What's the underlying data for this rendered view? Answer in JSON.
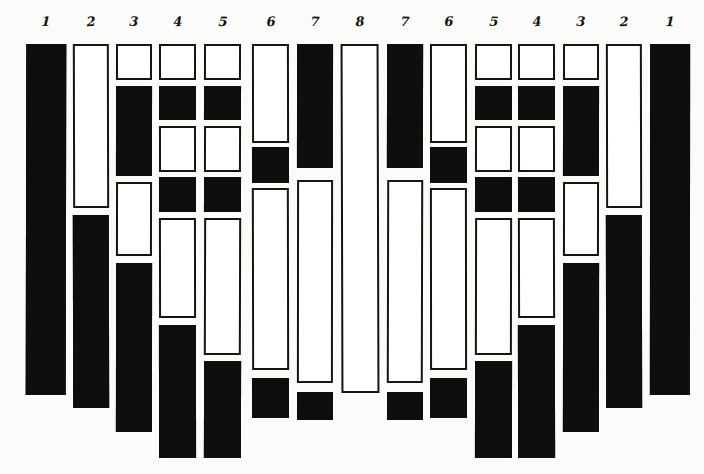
{
  "figure": {
    "title": "",
    "background_color": "#fbfbf9",
    "fill_color": "#100e0c",
    "open_color": "#ffffff",
    "stroke_color": "#16140f",
    "width": 704,
    "height": 474,
    "column_count": 15
  },
  "chart_data": {
    "type": "bar",
    "title": "",
    "xlabel": "",
    "ylabel": "",
    "grid": false,
    "legend": null,
    "orientation": "vertical",
    "categories": [
      "1",
      "2",
      "3",
      "4",
      "5",
      "6",
      "7",
      "8",
      "7",
      "6",
      "5",
      "4",
      "3",
      "2",
      "1"
    ],
    "columns": [
      {
        "label": "1",
        "x": 26,
        "width": 40,
        "segment_count": 1,
        "segments": [
          {
            "fill": "filled",
            "top": 44,
            "bottom": 395,
            "height": 351
          }
        ]
      },
      {
        "label": "2",
        "x": 73,
        "width": 36,
        "segment_count": 2,
        "segments": [
          {
            "fill": "open",
            "top": 44,
            "bottom": 208,
            "height": 164
          },
          {
            "fill": "filled",
            "top": 215,
            "bottom": 408,
            "height": 193
          }
        ]
      },
      {
        "label": "3",
        "x": 116,
        "width": 36,
        "segment_count": 4,
        "segments": [
          {
            "fill": "open",
            "top": 44,
            "bottom": 80,
            "height": 36
          },
          {
            "fill": "filled",
            "top": 86,
            "bottom": 176,
            "height": 90
          },
          {
            "fill": "open",
            "top": 182,
            "bottom": 256,
            "height": 74
          },
          {
            "fill": "filled",
            "top": 263,
            "bottom": 432,
            "height": 169
          }
        ]
      },
      {
        "label": "4",
        "x": 159,
        "width": 37,
        "segment_count": 6,
        "segments": [
          {
            "fill": "open",
            "top": 44,
            "bottom": 80,
            "height": 36
          },
          {
            "fill": "filled",
            "top": 86,
            "bottom": 120,
            "height": 34
          },
          {
            "fill": "open",
            "top": 126,
            "bottom": 172,
            "height": 46
          },
          {
            "fill": "filled",
            "top": 177,
            "bottom": 212,
            "height": 35
          },
          {
            "fill": "open",
            "top": 218,
            "bottom": 318,
            "height": 100
          },
          {
            "fill": "filled",
            "top": 325,
            "bottom": 458,
            "height": 133
          }
        ]
      },
      {
        "label": "5",
        "x": 204,
        "width": 37,
        "segment_count": 6,
        "segments": [
          {
            "fill": "open",
            "top": 44,
            "bottom": 80,
            "height": 36
          },
          {
            "fill": "filled",
            "top": 86,
            "bottom": 120,
            "height": 34
          },
          {
            "fill": "open",
            "top": 126,
            "bottom": 172,
            "height": 46
          },
          {
            "fill": "filled",
            "top": 177,
            "bottom": 212,
            "height": 35
          },
          {
            "fill": "open",
            "top": 218,
            "bottom": 355,
            "height": 137
          },
          {
            "fill": "filled",
            "top": 361,
            "bottom": 458,
            "height": 97
          }
        ]
      },
      {
        "label": "6",
        "x": 252,
        "width": 37,
        "segment_count": 4,
        "segments": [
          {
            "fill": "open",
            "top": 44,
            "bottom": 143,
            "height": 99
          },
          {
            "fill": "filled",
            "top": 147,
            "bottom": 183,
            "height": 36
          },
          {
            "fill": "open",
            "top": 188,
            "bottom": 370,
            "height": 182
          },
          {
            "fill": "filled",
            "top": 378,
            "bottom": 418,
            "height": 40
          }
        ]
      },
      {
        "label": "7",
        "x": 297,
        "width": 36,
        "segment_count": 3,
        "segments": [
          {
            "fill": "filled",
            "top": 44,
            "bottom": 168,
            "height": 124
          },
          {
            "fill": "open",
            "top": 180,
            "bottom": 383,
            "height": 203
          },
          {
            "fill": "filled",
            "top": 392,
            "bottom": 420,
            "height": 28
          }
        ]
      },
      {
        "label": "8",
        "x": 341,
        "width": 38,
        "segment_count": 1,
        "segments": [
          {
            "fill": "open",
            "top": 44,
            "bottom": 393,
            "height": 349
          }
        ]
      },
      {
        "label": "7",
        "x": 387,
        "width": 36,
        "segment_count": 3,
        "segments": [
          {
            "fill": "filled",
            "top": 44,
            "bottom": 168,
            "height": 124
          },
          {
            "fill": "open",
            "top": 180,
            "bottom": 383,
            "height": 203
          },
          {
            "fill": "filled",
            "top": 392,
            "bottom": 420,
            "height": 28
          }
        ]
      },
      {
        "label": "6",
        "x": 430,
        "width": 37,
        "segment_count": 4,
        "segments": [
          {
            "fill": "open",
            "top": 44,
            "bottom": 143,
            "height": 99
          },
          {
            "fill": "filled",
            "top": 147,
            "bottom": 183,
            "height": 36
          },
          {
            "fill": "open",
            "top": 188,
            "bottom": 370,
            "height": 182
          },
          {
            "fill": "filled",
            "top": 378,
            "bottom": 418,
            "height": 40
          }
        ]
      },
      {
        "label": "5",
        "x": 475,
        "width": 37,
        "segment_count": 6,
        "segments": [
          {
            "fill": "open",
            "top": 44,
            "bottom": 80,
            "height": 36
          },
          {
            "fill": "filled",
            "top": 86,
            "bottom": 120,
            "height": 34
          },
          {
            "fill": "open",
            "top": 126,
            "bottom": 172,
            "height": 46
          },
          {
            "fill": "filled",
            "top": 177,
            "bottom": 212,
            "height": 35
          },
          {
            "fill": "open",
            "top": 218,
            "bottom": 355,
            "height": 137
          },
          {
            "fill": "filled",
            "top": 361,
            "bottom": 458,
            "height": 97
          }
        ]
      },
      {
        "label": "4",
        "x": 518,
        "width": 37,
        "segment_count": 6,
        "segments": [
          {
            "fill": "open",
            "top": 44,
            "bottom": 80,
            "height": 36
          },
          {
            "fill": "filled",
            "top": 86,
            "bottom": 120,
            "height": 34
          },
          {
            "fill": "open",
            "top": 126,
            "bottom": 172,
            "height": 46
          },
          {
            "fill": "filled",
            "top": 177,
            "bottom": 212,
            "height": 35
          },
          {
            "fill": "open",
            "top": 218,
            "bottom": 318,
            "height": 100
          },
          {
            "fill": "filled",
            "top": 325,
            "bottom": 458,
            "height": 133
          }
        ]
      },
      {
        "label": "3",
        "x": 563,
        "width": 36,
        "segment_count": 4,
        "segments": [
          {
            "fill": "open",
            "top": 44,
            "bottom": 80,
            "height": 36
          },
          {
            "fill": "filled",
            "top": 86,
            "bottom": 176,
            "height": 90
          },
          {
            "fill": "open",
            "top": 182,
            "bottom": 256,
            "height": 74
          },
          {
            "fill": "filled",
            "top": 263,
            "bottom": 432,
            "height": 169
          }
        ]
      },
      {
        "label": "2",
        "x": 606,
        "width": 36,
        "segment_count": 2,
        "segments": [
          {
            "fill": "open",
            "top": 44,
            "bottom": 208,
            "height": 164
          },
          {
            "fill": "filled",
            "top": 215,
            "bottom": 408,
            "height": 193
          }
        ]
      },
      {
        "label": "1",
        "x": 650,
        "width": 40,
        "segment_count": 1,
        "segments": [
          {
            "fill": "filled",
            "top": 44,
            "bottom": 395,
            "height": 351
          }
        ]
      }
    ]
  }
}
